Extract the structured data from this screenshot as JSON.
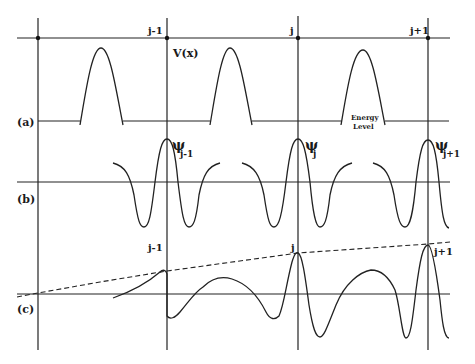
{
  "figure": {
    "panel_labels": {
      "a": "(a)",
      "b": "(b)",
      "c": "(c)"
    },
    "lattice_sites": [
      "",
      "j-1",
      "j",
      "j+1"
    ],
    "panel_a": {
      "potential_label": "V(x)",
      "energy_label_line1": "Energy",
      "energy_label_line2": "Level"
    },
    "panel_b": {
      "psi_symbol": "ψ",
      "psi_subscripts": [
        "j-1",
        "j",
        "j+1"
      ]
    },
    "panel_c": {
      "site_labels": [
        "j-1",
        "j",
        "j+1"
      ]
    }
  }
}
